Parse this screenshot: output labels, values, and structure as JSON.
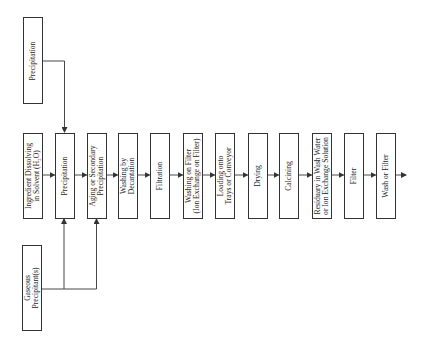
{
  "diagram": {
    "type": "process-flowchart",
    "orientation": "rotated-90",
    "inputs": {
      "top": {
        "label_lines": [
          "Precipitation"
        ]
      },
      "bottom": {
        "label_lines": [
          "Gaseous",
          "Precipitant(s)"
        ]
      }
    },
    "steps": [
      {
        "label_lines": [
          "Ingredient Dissolving",
          "in Solvent (H₂O)"
        ]
      },
      {
        "label_lines": [
          "Precipitation"
        ]
      },
      {
        "label_lines": [
          "Aging or Secondary",
          "Precipitation"
        ]
      },
      {
        "label_lines": [
          "Washing by",
          "Decantation"
        ]
      },
      {
        "label_lines": [
          "Filtration"
        ]
      },
      {
        "label_lines": [
          "Washing on Filter",
          "(Ion Exchange on Filter)"
        ]
      },
      {
        "label_lines": [
          "Loading onto",
          "Trays or Conveyor"
        ]
      },
      {
        "label_lines": [
          "Drying"
        ]
      },
      {
        "label_lines": [
          "Calcining"
        ]
      },
      {
        "label_lines": [
          "Residuary in Wash Water",
          "or Ion Exchange Solution"
        ]
      },
      {
        "label_lines": [
          "Filter"
        ]
      },
      {
        "label_lines": [
          "Wash or Filter"
        ]
      }
    ],
    "edges": [
      {
        "from": "Precipitation (top input)",
        "to": "Precipitation"
      },
      {
        "from": "Gaseous Precipitant(s)",
        "to": "Precipitation"
      },
      {
        "from": "Gaseous Precipitant(s)",
        "to": "Aging or Secondary Precipitation"
      },
      {
        "from": "Ingredient Dissolving in Solvent (H2O)",
        "to": "Precipitation"
      },
      {
        "from": "Precipitation",
        "to": "Aging or Secondary Precipitation"
      },
      {
        "from": "Aging or Secondary Precipitation",
        "to": "Washing by Decantation"
      },
      {
        "from": "Washing by Decantation",
        "to": "Filtration"
      },
      {
        "from": "Filtration",
        "to": "Washing on Filter (Ion Exchange on Filter)"
      },
      {
        "from": "Washing on Filter (Ion Exchange on Filter)",
        "to": "Loading onto Trays or Conveyor"
      },
      {
        "from": "Loading onto Trays or Conveyor",
        "to": "Drying"
      },
      {
        "from": "Drying",
        "to": "Calcining"
      },
      {
        "from": "Calcining",
        "to": "Residuary in Wash Water or Ion Exchange Solution"
      },
      {
        "from": "Residuary in Wash Water or Ion Exchange Solution",
        "to": "Filter"
      },
      {
        "from": "Filter",
        "to": "Wash or Filter"
      },
      {
        "from": "Wash or Filter",
        "to": "(output)"
      }
    ],
    "colors": {
      "line": "#333333",
      "text": "#1a1a1a",
      "background": "#ffffff"
    }
  }
}
